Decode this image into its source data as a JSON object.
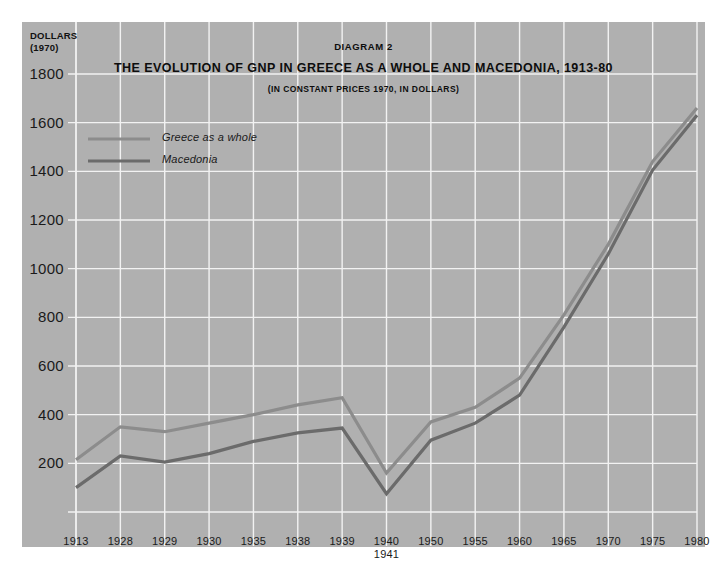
{
  "figure": {
    "diagram_number": "DIAGRAM 2",
    "title": "THE EVOLUTION OF GNP IN GREECE AS A WHOLE AND MACEDONIA, 1913-80",
    "subtitle": "(IN CONSTANT PRICES 1970, IN DOLLARS)",
    "axis_unit_label": "DOLLARS\n(1970)",
    "panel_color": "#b0b0b0",
    "grid_color": "#f2f2f2"
  },
  "legend": {
    "position": "inside-top-left",
    "entries": [
      {
        "label": "Greece as a whole",
        "color": "#8c8c8c"
      },
      {
        "label": "Macedonia",
        "color": "#6b6b6b"
      }
    ]
  },
  "chart_data": {
    "type": "line",
    "title": "THE EVOLUTION OF GNP IN GREECE AS A WHOLE AND MACEDONIA, 1913-80",
    "subtitle": "(IN CONSTANT PRICES 1970, IN DOLLARS)",
    "xlabel": "",
    "ylabel": "DOLLARS (1970)",
    "grid": true,
    "ylim": [
      0,
      1800
    ],
    "yticks": [
      0,
      200,
      400,
      600,
      800,
      1000,
      1200,
      1400,
      1600,
      1800
    ],
    "ytick_labels": [
      "",
      "200",
      "400",
      "600",
      "800",
      "1000",
      "1200",
      "1400",
      "1600",
      "1800"
    ],
    "categories": [
      "1913",
      "1928",
      "1929",
      "1930",
      "1935",
      "1938",
      "1939",
      "1940\n1941",
      "1950",
      "1955",
      "1960",
      "1965",
      "1970",
      "1975",
      "1980"
    ],
    "xtick_labels": [
      "1913",
      "1928",
      "1929",
      "1930",
      "1935",
      "1938",
      "1939",
      "1940\n1941",
      "1950",
      "1955",
      "1960",
      "1965",
      "1970",
      "1975",
      "1980"
    ],
    "series": [
      {
        "name": "Greece as a whole",
        "color": "#8c8c8c",
        "values": [
          215,
          350,
          330,
          365,
          400,
          440,
          470,
          160,
          370,
          430,
          550,
          810,
          1100,
          1440,
          1660
        ]
      },
      {
        "name": "Macedonia",
        "color": "#6b6b6b",
        "values": [
          100,
          230,
          205,
          240,
          290,
          325,
          345,
          75,
          295,
          365,
          480,
          760,
          1060,
          1405,
          1630
        ]
      }
    ]
  }
}
